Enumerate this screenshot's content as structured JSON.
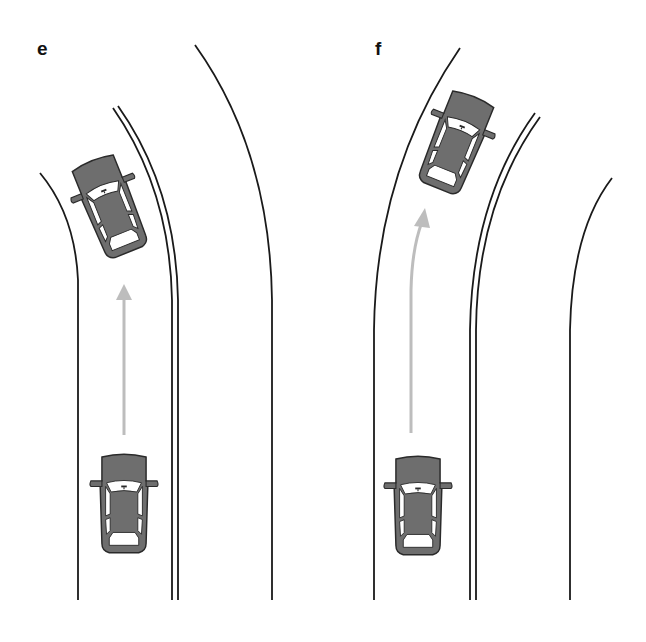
{
  "figure": {
    "panels": [
      {
        "id": "e",
        "label": "e",
        "description": "Car in straight lane before a left curve, arrow pointing straight ahead; ghost car drifting toward center line in curve",
        "arrow": {
          "style": "straight",
          "color": "#bdbdbd"
        },
        "cars": [
          {
            "role": "current-position",
            "color": "#6e6e6e"
          },
          {
            "role": "future-position",
            "color": "#6e6e6e"
          }
        ]
      },
      {
        "id": "f",
        "label": "f",
        "description": "Car in straight lane before a right curve, arrow curving right; ghost car drifting toward outer edge in curve",
        "arrow": {
          "style": "curved",
          "color": "#bdbdbd"
        },
        "cars": [
          {
            "role": "current-position",
            "color": "#6e6e6e"
          },
          {
            "role": "future-position",
            "color": "#6e6e6e"
          }
        ]
      }
    ],
    "colors": {
      "road_line": "#1a1a1a",
      "car_fill": "#6e6e6e",
      "arrow": "#bdbdbd",
      "background": "#ffffff"
    }
  }
}
